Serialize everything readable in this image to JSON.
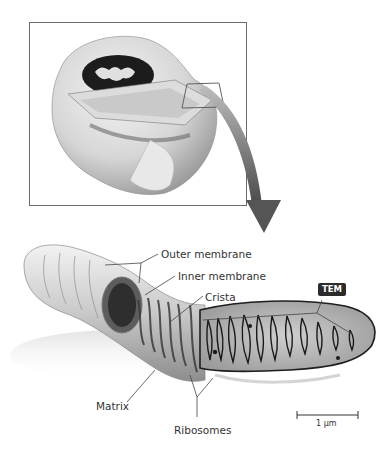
{
  "figure": {
    "type": "biology-diagram"
  },
  "top_panel": {
    "description": "Cutaway cell illustration with highlighted callout region",
    "callout_box": "zoom-region"
  },
  "arrow": {
    "direction": "down",
    "color": "#5a5a5a"
  },
  "labels": {
    "outer_membrane": "Outer membrane",
    "inner_membrane": "Inner membrane",
    "crista": "Crista",
    "matrix": "Matrix",
    "ribosomes": "Ribosomes"
  },
  "badge": {
    "tem": "TEM"
  },
  "scale_bar": {
    "label": "1 µm"
  },
  "colors": {
    "frame": "#6a6a6a",
    "badge_bg": "#2b2b2b",
    "leader_line": "#444444",
    "arrow": "#5a5a5a"
  }
}
